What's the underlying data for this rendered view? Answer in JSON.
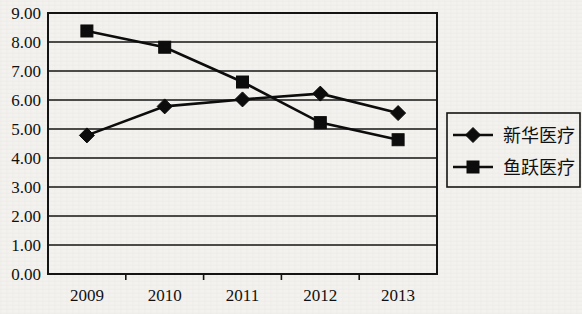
{
  "chart_data": {
    "type": "line",
    "title": "",
    "xlabel": "",
    "ylabel": "",
    "categories": [
      "2009",
      "2010",
      "2011",
      "2012",
      "2013"
    ],
    "ylim": [
      0.0,
      9.0
    ],
    "ytick_labels": [
      "0.00",
      "1.00",
      "2.00",
      "3.00",
      "4.00",
      "5.00",
      "6.00",
      "7.00",
      "8.00",
      "9.00"
    ],
    "ytick_values": [
      0,
      1,
      2,
      3,
      4,
      5,
      6,
      7,
      8,
      9
    ],
    "grid": true,
    "legend_position": "right",
    "series": [
      {
        "name": "新华医疗",
        "marker": "diamond",
        "color": "#0d0d0d",
        "values": [
          4.78,
          5.78,
          6.02,
          6.22,
          5.55
        ]
      },
      {
        "name": "鱼跃医疗",
        "marker": "square",
        "color": "#0d0d0d",
        "values": [
          8.38,
          7.82,
          6.62,
          5.22,
          4.63
        ]
      }
    ]
  },
  "legend": {
    "entries": [
      {
        "label": "新华医疗",
        "marker": "diamond"
      },
      {
        "label": "鱼跃医疗",
        "marker": "square"
      }
    ]
  }
}
